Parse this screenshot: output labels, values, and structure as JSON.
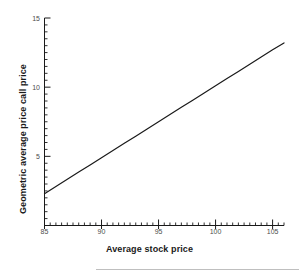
{
  "chart_data": {
    "type": "line",
    "title": "",
    "xlabel": "Average stock price",
    "ylabel": "Geometric average price call price",
    "xlim": [
      85,
      106
    ],
    "ylim": [
      0,
      15
    ],
    "xticks": [
      85,
      90,
      95,
      100,
      105
    ],
    "xtick_labels": [
      "85",
      "90",
      "95",
      "100",
      "105"
    ],
    "yticks": [
      5,
      10,
      15
    ],
    "ytick_labels": [
      "5",
      "10",
      "15"
    ],
    "x_minor_tick_step": 0.5,
    "y_minor_tick_step": 0.5,
    "grid": false,
    "legend": null,
    "series": [
      {
        "name": "Geometric average price call price",
        "color": "#1a1a1a",
        "line_width": 1.2,
        "x": [
          85,
          86,
          87,
          88,
          89,
          90,
          91,
          92,
          93,
          94,
          95,
          96,
          97,
          98,
          99,
          100,
          101,
          102,
          103,
          104,
          105,
          106
        ],
        "values": [
          2.3,
          2.82,
          3.34,
          3.86,
          4.38,
          4.9,
          5.42,
          5.94,
          6.46,
          6.98,
          7.5,
          8.02,
          8.54,
          9.06,
          9.58,
          10.1,
          10.62,
          11.14,
          11.66,
          12.18,
          12.7,
          13.2
        ]
      }
    ]
  },
  "axes": {
    "spine_color": "#1a1a1a",
    "tick_color": "#1a1a1a",
    "tick_label_color": "#4d4d4d",
    "background": "#ffffff"
  },
  "footer": {
    "rule_color": "#bfbfbf"
  }
}
